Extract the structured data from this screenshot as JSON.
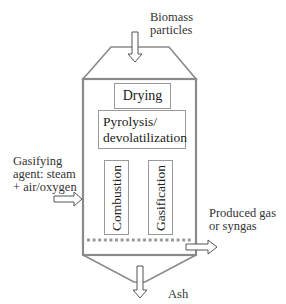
{
  "diagram": {
    "inputs": {
      "feed": {
        "label_line1": "Biomass",
        "label_line2": "particles",
        "icon": "arrow-down-icon"
      },
      "agent": {
        "label_line1": "Gasifying",
        "label_line2": "agent: steam",
        "label_line3": "+ air/oxygen",
        "icon": "arrow-right-icon"
      }
    },
    "outputs": {
      "gas": {
        "label_line1": "Produced gas",
        "label_line2": "or syngas",
        "icon": "arrow-right-icon"
      },
      "ash": {
        "label": "Ash",
        "icon": "arrow-down-icon"
      }
    },
    "zones": [
      {
        "id": "drying",
        "label": "Drying"
      },
      {
        "id": "pyrolysis",
        "label_line1": "Pyrolysis/",
        "label_line2": "devolatilization"
      },
      {
        "id": "combustion",
        "label": "Combustion"
      },
      {
        "id": "gasification",
        "label": "Gasification"
      }
    ],
    "colors": {
      "vessel_stroke": "#8a8a8a",
      "box_stroke": "#999999",
      "grate": "#999999",
      "text": "#222222"
    }
  }
}
